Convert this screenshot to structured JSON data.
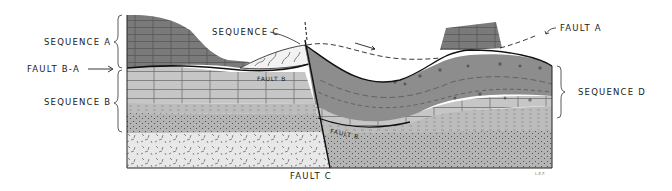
{
  "diagram": {
    "type": "geologic-cross-section",
    "labels": {
      "sequence_a": "SEQUENCE  A",
      "fault_ba": "FAULT  B-A",
      "sequence_b": "SEQUENCE  B",
      "sequence_c": "SEQUENCE  C",
      "fault_a": "FAULT  A",
      "sequence_d": "SEQUENCE  D",
      "fault_c": "FAULT  C",
      "fault_b_left": "FAULT  B",
      "fault_b_right": "FAULT  B",
      "signature": "L.E.F."
    },
    "colors": {
      "sequence_a": "#7d7d7d",
      "sequence_b_upper": "#c4c4c4",
      "sequence_b_stipple": "#b0b0b0",
      "basement": "#e6e6e6",
      "sequence_c": "#f4f4f4",
      "sequence_d": "#8f8f8f",
      "line": "#1a1a1a"
    }
  }
}
